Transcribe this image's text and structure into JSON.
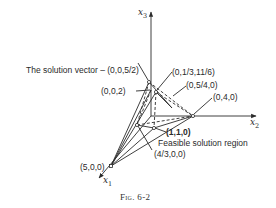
{
  "figure": {
    "caption": "Fig. 6-2",
    "axes": {
      "x1": {
        "name": "x",
        "sub": "1"
      },
      "x2": {
        "name": "x",
        "sub": "2"
      },
      "x3": {
        "name": "x",
        "sub": "3"
      }
    },
    "labels": {
      "solution_vector": "The solution vector – (0,0,5/2)",
      "p_0_13_116": "(0,1/3,11/6)",
      "p_0_54_0": "(0,5/4,0)",
      "p_002": "(0,0,2)",
      "p_040": "(0,4,0)",
      "p_110": "(1,1,0)",
      "feasible_region": "Feasible solution region",
      "p_43_00": "(4/3,0,0)",
      "p_500": "(5,0,0)"
    },
    "colors": {
      "ink": "#2a2a2a",
      "background": "#ffffff"
    }
  }
}
